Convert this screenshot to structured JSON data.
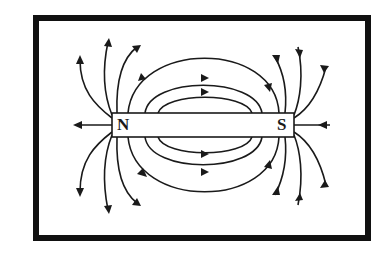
{
  "diagram": {
    "type": "magnetic-field-lines",
    "poles": {
      "north_label": "N",
      "south_label": "S"
    },
    "colors": {
      "ink": "#1a1a1a",
      "background": "#ffffff",
      "frame": "#111111"
    },
    "field_direction": "N to S (outside magnet)",
    "lines": {
      "inner_loops_above": 3,
      "inner_loops_below": 3,
      "north_fan_lines": 7,
      "south_fan_lines": 7
    }
  }
}
